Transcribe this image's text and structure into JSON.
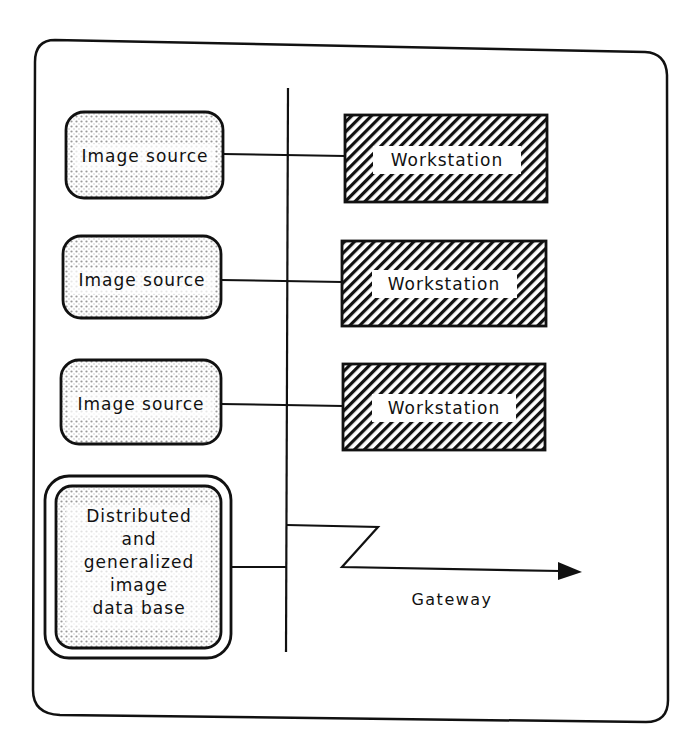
{
  "diagram": {
    "type": "network architecture",
    "colors": {
      "ink": "#111111",
      "background": "#ffffff",
      "dot_fill": "#bdbdbd"
    },
    "image_sources": [
      {
        "label": "Image source"
      },
      {
        "label": "Image source"
      },
      {
        "label": "Image source"
      }
    ],
    "workstations": [
      {
        "label": "Workstation"
      },
      {
        "label": "Workstation"
      },
      {
        "label": "Workstation"
      }
    ],
    "database": {
      "lines": [
        "Distributed",
        "and",
        "generalized",
        "image",
        "data base"
      ]
    },
    "gateway": {
      "label": "Gateway"
    }
  }
}
